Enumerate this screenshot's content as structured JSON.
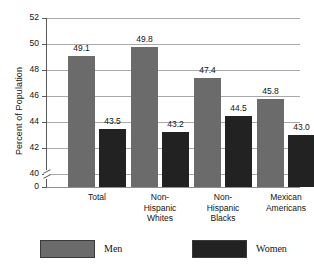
{
  "chart_data": {
    "type": "bar",
    "title": "",
    "subtitle": "",
    "xlabel": "",
    "ylabel": "Percent of Population",
    "categories": [
      "Total",
      "Non-Hispanic Whites",
      "Non-Hispanic Blacks",
      "Mexican Americans"
    ],
    "category_lines": [
      [
        "Total"
      ],
      [
        "Non-",
        "Hispanic",
        "Whites"
      ],
      [
        "Non-",
        "Hispanic",
        "Blacks"
      ],
      [
        "Mexican",
        "Americans"
      ]
    ],
    "series": [
      {
        "name": "Men",
        "color": "#6b6b6b",
        "values": [
          49.1,
          49.8,
          47.4,
          45.8
        ],
        "labels": [
          "49.1",
          "49.8",
          "47.4",
          "45.8"
        ]
      },
      {
        "name": "Women",
        "color": "#222222",
        "values": [
          43.5,
          43.2,
          44.5,
          43.0
        ],
        "labels": [
          "43.5",
          "43.2",
          "44.5",
          "43.0"
        ]
      }
    ],
    "ylim": [
      40,
      52
    ],
    "y_axis_broken": true,
    "y_break_from": 0,
    "y_break_to": 40,
    "yticks": [
      52,
      50,
      48,
      46,
      44,
      42,
      40,
      0
    ],
    "ytick_labels": [
      "52",
      "50",
      "48",
      "46",
      "44",
      "42",
      "40",
      "0"
    ],
    "grid": true,
    "grid_axis": "y",
    "legend_position": "bottom",
    "legend": [
      "Men",
      "Women"
    ]
  },
  "legend": {
    "men_label": "Men",
    "women_label": "Women"
  },
  "colors": {
    "men": "#6b6b6b",
    "women": "#222222",
    "gridline": "#a9a9a9",
    "axis": "#5a5a5a",
    "background": "#ffffff",
    "text": "#141414"
  }
}
